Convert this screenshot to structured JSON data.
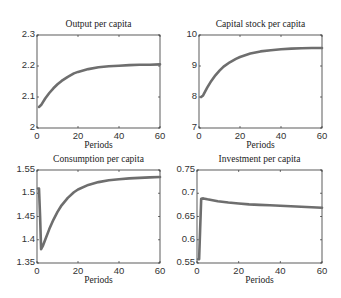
{
  "chart_data": [
    {
      "type": "line",
      "title": "Output per capita",
      "xlabel": "Periods",
      "ylabel": "",
      "xlim": [
        0,
        60
      ],
      "ylim": [
        2.0,
        2.3
      ],
      "xticks": [
        "0",
        "20",
        "40",
        "60"
      ],
      "yticks": [
        "2",
        "2.1",
        "2.2",
        "2.3"
      ],
      "grid": false,
      "series": [
        {
          "name": "Output per capita",
          "x": [
            1,
            2,
            4,
            6,
            8,
            10,
            12,
            15,
            18,
            20,
            25,
            30,
            35,
            40,
            45,
            50,
            55,
            60
          ],
          "values": [
            2.068,
            2.074,
            2.095,
            2.113,
            2.128,
            2.141,
            2.152,
            2.165,
            2.176,
            2.181,
            2.19,
            2.196,
            2.199,
            2.201,
            2.203,
            2.204,
            2.204,
            2.205
          ]
        }
      ]
    },
    {
      "type": "line",
      "title": "Capital stock per capita",
      "xlabel": "Periods",
      "ylabel": "",
      "xlim": [
        0,
        60
      ],
      "ylim": [
        7,
        10
      ],
      "xticks": [
        "0",
        "20",
        "40",
        "60"
      ],
      "yticks": [
        "7",
        "8",
        "9",
        "10"
      ],
      "grid": false,
      "series": [
        {
          "name": "Capital stock per capita",
          "x": [
            1,
            2,
            4,
            6,
            8,
            10,
            12,
            15,
            18,
            20,
            25,
            30,
            35,
            40,
            45,
            50,
            55,
            60
          ],
          "values": [
            8.0,
            8.05,
            8.3,
            8.52,
            8.7,
            8.85,
            8.98,
            9.12,
            9.23,
            9.29,
            9.4,
            9.47,
            9.51,
            9.54,
            9.56,
            9.57,
            9.58,
            9.58
          ]
        }
      ]
    },
    {
      "type": "line",
      "title": "Consumption per capita",
      "xlabel": "Periods",
      "ylabel": "",
      "xlim": [
        0,
        60
      ],
      "ylim": [
        1.35,
        1.55
      ],
      "xticks": [
        "0",
        "20",
        "40",
        "60"
      ],
      "yticks": [
        "1.35",
        "1.4",
        "1.45",
        "1.5",
        "1.55"
      ],
      "grid": false,
      "series": [
        {
          "name": "Consumption per capita",
          "x": [
            0.5,
            1,
            1.5,
            2,
            3,
            4,
            6,
            8,
            10,
            12,
            15,
            18,
            20,
            25,
            30,
            35,
            40,
            45,
            50,
            55,
            60
          ],
          "values": [
            1.51,
            1.51,
            1.45,
            1.38,
            1.388,
            1.4,
            1.423,
            1.443,
            1.46,
            1.474,
            1.49,
            1.502,
            1.508,
            1.518,
            1.524,
            1.528,
            1.53,
            1.532,
            1.533,
            1.534,
            1.535
          ]
        }
      ]
    },
    {
      "type": "line",
      "title": "Investment per capita",
      "xlabel": "Periods",
      "ylabel": "",
      "xlim": [
        0,
        60
      ],
      "ylim": [
        0.55,
        0.75
      ],
      "xticks": [
        "0",
        "20",
        "40",
        "60"
      ],
      "yticks": [
        "0.55",
        "0.6",
        "0.65",
        "0.7",
        "0.75"
      ],
      "grid": false,
      "series": [
        {
          "name": "Investment per capita",
          "x": [
            0.5,
            1,
            1.5,
            2,
            3,
            5,
            10,
            15,
            20,
            25,
            30,
            35,
            40,
            45,
            50,
            55,
            60
          ],
          "values": [
            0.558,
            0.558,
            0.62,
            0.688,
            0.689,
            0.687,
            0.683,
            0.68,
            0.678,
            0.676,
            0.675,
            0.674,
            0.673,
            0.672,
            0.671,
            0.67,
            0.669
          ]
        }
      ]
    }
  ],
  "style": {
    "line_color": "#6e6e6e",
    "axis_color": "#333333"
  }
}
